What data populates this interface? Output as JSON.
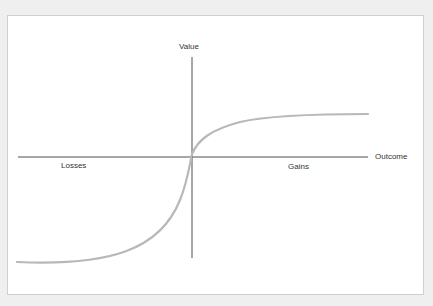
{
  "diagram": {
    "y_axis_label": "Value",
    "x_axis_label": "Outcome",
    "left_region_label": "Losses",
    "right_region_label": "Gains",
    "curve_color": "#b8b8b8",
    "axis_color": "#222222"
  }
}
